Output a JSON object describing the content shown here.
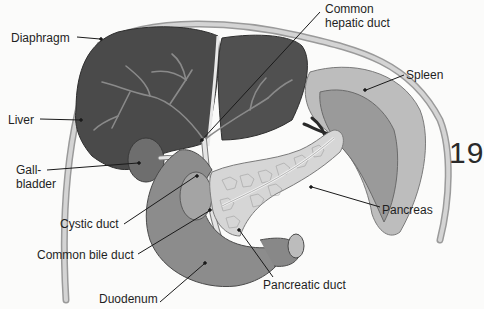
{
  "figure": {
    "labels": {
      "diaphragm": "Diaphragm",
      "liver": "Liver",
      "gallbladder_1": "Gall-",
      "gallbladder_2": "bladder",
      "cystic_duct": "Cystic duct",
      "common_bile_duct": "Common bile duct",
      "duodenum": "Duodenum",
      "common_hepatic_duct_1": "Common",
      "common_hepatic_duct_2": "hepatic duct",
      "spleen": "Spleen",
      "pancreas": "Pancreas",
      "pancreatic_duct": "Pancreatic duct"
    },
    "colors": {
      "liver": "#4a4a4a",
      "liver_vessels": "#8a8a8a",
      "diaphragm": "#c8c8c8",
      "spleen_outer": "#bdbdbd",
      "spleen_inner": "#9a9a9a",
      "duodenum": "#8c8c8c",
      "pancreas": "#d6d6d6",
      "gallbladder": "#6e6e6e",
      "ducts": "#e4e4e4",
      "leader": "#1a1a1a",
      "background": "#fbfbfa"
    }
  },
  "page": {
    "page_number_fragment": "19"
  }
}
